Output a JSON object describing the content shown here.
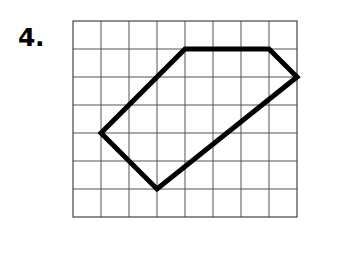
{
  "page": {
    "background_color": "#ffffff",
    "width": 341,
    "height": 257
  },
  "problem": {
    "number_label": "4."
  },
  "grid": {
    "origin_x": 73,
    "origin_y": 21,
    "cell_size": 28,
    "columns": 8,
    "rows": 7,
    "line_color": "#555555",
    "line_width": 1,
    "border_color": "#444444",
    "border_width": 1.2
  },
  "figure": {
    "name": "polygon",
    "sides": 5,
    "stroke_color": "#000000",
    "stroke_width": 5,
    "fill": "none",
    "closed": true,
    "vertices_grid": [
      {
        "col": 4,
        "row": 1
      },
      {
        "col": 7,
        "row": 1
      },
      {
        "col": 8,
        "row": 2
      },
      {
        "col": 3,
        "row": 6
      },
      {
        "col": 1,
        "row": 4
      }
    ],
    "vertices_px": [
      {
        "x": 185,
        "y": 49
      },
      {
        "x": 269,
        "y": 49
      },
      {
        "x": 297,
        "y": 77
      },
      {
        "x": 157,
        "y": 217
      },
      {
        "x": 101,
        "y": 133
      }
    ]
  }
}
